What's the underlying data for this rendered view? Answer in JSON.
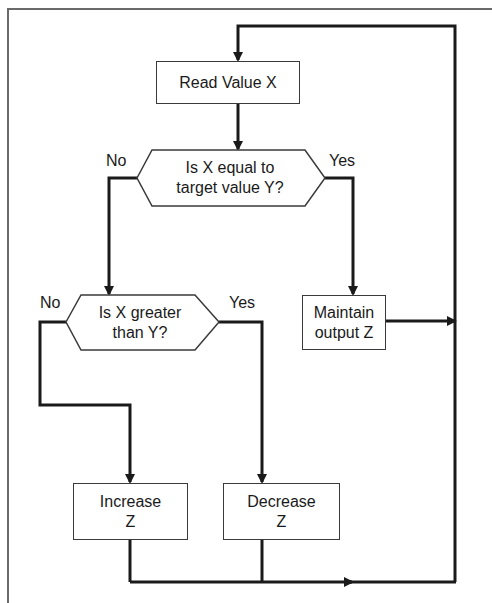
{
  "diagram": {
    "type": "flowchart",
    "nodes": {
      "read_value": {
        "label": "Read Value X",
        "shape": "rectangle"
      },
      "decision_equal": {
        "line1": "Is X equal to",
        "line2": "target value Y?",
        "shape": "hexagon"
      },
      "decision_greater": {
        "line1": "Is X greater",
        "line2": "than Y?",
        "shape": "hexagon"
      },
      "maintain": {
        "line1": "Maintain",
        "line2": "output Z",
        "shape": "rectangle"
      },
      "increase": {
        "line1": "Increase",
        "line2": "Z",
        "shape": "rectangle"
      },
      "decrease": {
        "line1": "Decrease",
        "line2": "Z",
        "shape": "rectangle"
      }
    },
    "edge_labels": {
      "equal_no": "No",
      "equal_yes": "Yes",
      "greater_no": "No",
      "greater_yes": "Yes"
    },
    "edges": [
      {
        "from": "read_value",
        "to": "decision_equal"
      },
      {
        "from": "decision_equal",
        "to": "decision_greater",
        "label": "No"
      },
      {
        "from": "decision_equal",
        "to": "maintain",
        "label": "Yes"
      },
      {
        "from": "decision_greater",
        "to": "increase",
        "label": "No"
      },
      {
        "from": "decision_greater",
        "to": "decrease",
        "label": "Yes"
      },
      {
        "from": "maintain",
        "to": "read_value",
        "note": "loop back"
      },
      {
        "from": "increase",
        "to": "read_value",
        "note": "loop back"
      },
      {
        "from": "decrease",
        "to": "read_value",
        "note": "loop back"
      }
    ],
    "colors": {
      "line": "#1a1a1a",
      "frame": "#6a6a6a",
      "background": "#ffffff"
    }
  }
}
